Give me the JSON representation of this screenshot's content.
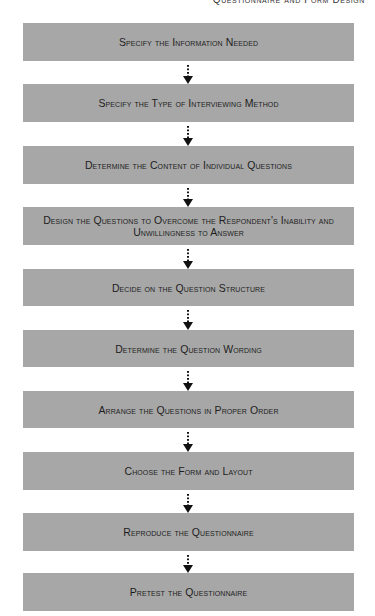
{
  "header": {
    "running_title": "Questionnaire and Form Design"
  },
  "flowchart": {
    "box_color": "#a7a7a7",
    "text_color": "#1e1e1e",
    "steps": [
      {
        "label": "Specify the Information Needed"
      },
      {
        "label": "Specify the Type of Interviewing Method"
      },
      {
        "label": "Determine the Content of Individual Questions"
      },
      {
        "label": "Design the Questions to Overcome the Respondent's Inability and Unwillingness to Answer"
      },
      {
        "label": "Decide on the Question Structure"
      },
      {
        "label": "Determine the Question Wording"
      },
      {
        "label": "Arrange the Questions in Proper Order"
      },
      {
        "label": "Choose the Form and Layout"
      },
      {
        "label": "Reproduce the Questionnaire"
      },
      {
        "label": "Pretest the Questionnaire"
      }
    ],
    "connector_style": "dotted-arrow-down"
  }
}
